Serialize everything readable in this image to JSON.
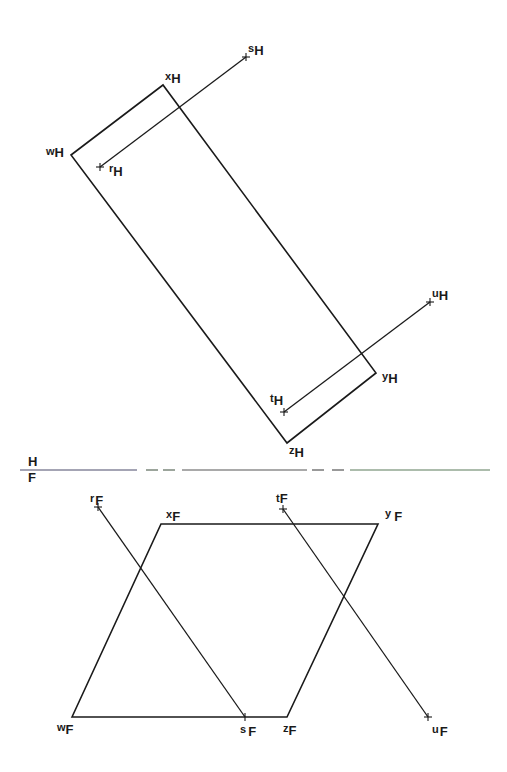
{
  "diagram": {
    "type": "descriptive-geometry orthographic projection",
    "views": [
      "horizontal",
      "frontal"
    ],
    "folding_line": {
      "label_top": "H",
      "label_bottom": "F",
      "color": "#555555"
    },
    "horizontal_view": {
      "plane_vertices": {
        "w": {
          "label": "w",
          "sub": "H"
        },
        "x": {
          "label": "x",
          "sub": "H"
        },
        "y": {
          "label": "y",
          "sub": "H"
        },
        "z": {
          "label": "z",
          "sub": "H"
        }
      },
      "line_rs": {
        "r": {
          "label": "r",
          "sub": "H"
        },
        "s": {
          "label": "s",
          "sub": "H"
        }
      },
      "line_tu": {
        "t": {
          "label": "t",
          "sub": "H"
        },
        "u": {
          "label": "u",
          "sub": "H"
        }
      }
    },
    "frontal_view": {
      "plane_vertices": {
        "w": {
          "label": "w",
          "sub": "F"
        },
        "x": {
          "label": "x",
          "sub": "F"
        },
        "y": {
          "label": "y",
          "sub": "F"
        },
        "z": {
          "label": "z",
          "sub": "F"
        }
      },
      "line_rs": {
        "r": {
          "label": "r",
          "sub": "F"
        },
        "s": {
          "label": "s",
          "sub": "F"
        }
      },
      "line_tu": {
        "t": {
          "label": "t",
          "sub": "F"
        },
        "u": {
          "label": "u",
          "sub": "F"
        }
      }
    }
  }
}
